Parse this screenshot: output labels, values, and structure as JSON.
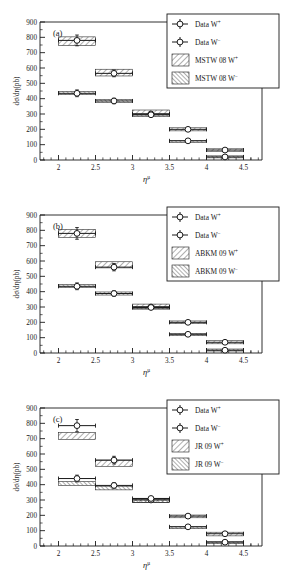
{
  "figure": {
    "width": 282,
    "height": 580,
    "panel_count": 3
  },
  "axes": {
    "ylabel": "dσ/dη(pb)",
    "xlabel_base": "η",
    "xlabel_sup": "μ",
    "ylim": [
      0,
      900
    ],
    "xlim": [
      1.75,
      4.75
    ],
    "yticks": [
      0,
      100,
      200,
      300,
      400,
      500,
      600,
      700,
      800,
      900
    ],
    "ytick_labels": [
      "0",
      "100",
      "200",
      "300",
      "400",
      "500",
      "600",
      "700",
      "800",
      "900"
    ],
    "xticks": [
      2,
      2.5,
      3,
      3.5,
      4,
      4.5
    ],
    "xtick_labels": [
      "2",
      "2.5",
      "3",
      "3.5",
      "4",
      "4.5"
    ],
    "minor_y_step": 50,
    "minor_x_step": 0.1,
    "grid": false
  },
  "legend": {
    "position": "top-right",
    "entries_common": [
      {
        "marker": "open-circle-errorbar",
        "label_base": "Data  W",
        "label_sup": "+"
      },
      {
        "marker": "open-circle-errorbar",
        "label_base": "Data  W",
        "label_sup": "−"
      }
    ]
  },
  "panels": [
    {
      "tag": "(a)",
      "model": "MSTW 08",
      "legend": [
        {
          "marker": "open-circle-errorbar",
          "label_base": "Data  W",
          "label_sup": "+"
        },
        {
          "marker": "open-circle-errorbar",
          "label_base": "Data  W",
          "label_sup": "−"
        },
        {
          "marker": "hatch-forward",
          "label_base": "MSTW 08 W",
          "label_sup": "+"
        },
        {
          "marker": "hatch-back",
          "label_base": "MSTW 08 W",
          "label_sup": "−"
        }
      ],
      "chart_ref": 0
    },
    {
      "tag": "(b)",
      "model": "ABKM 09",
      "legend": [
        {
          "marker": "open-circle-errorbar",
          "label_base": "Data  W",
          "label_sup": "+"
        },
        {
          "marker": "open-circle-errorbar",
          "label_base": "Data  W",
          "label_sup": "−"
        },
        {
          "marker": "hatch-forward",
          "label_base": "ABKM 09 W",
          "label_sup": "+"
        },
        {
          "marker": "hatch-back",
          "label_base": "ABKM 09 W",
          "label_sup": "−"
        }
      ],
      "chart_ref": 1
    },
    {
      "tag": "(c)",
      "model": "JR 09",
      "legend": [
        {
          "marker": "open-circle-errorbar",
          "label_base": "Data  W",
          "label_sup": "+"
        },
        {
          "marker": "open-circle-errorbar",
          "label_base": "Data  W",
          "label_sup": "−"
        },
        {
          "marker": "hatch-forward",
          "label_base": "JR 09 W",
          "label_sup": "+"
        },
        {
          "marker": "hatch-back",
          "label_base": "JR 09 W",
          "label_sup": "−"
        }
      ],
      "chart_ref": 2
    }
  ],
  "chart_data": [
    {
      "type": "scatter",
      "title": "(a) MSTW 08 prediction vs data",
      "xlabel": "eta_mu",
      "ylabel": "dsigma/deta (pb)",
      "xlim": [
        1.75,
        4.75
      ],
      "ylim": [
        0,
        900
      ],
      "grid": false,
      "bin_edges": [
        [
          2.0,
          2.5
        ],
        [
          2.5,
          3.0
        ],
        [
          3.0,
          3.5
        ],
        [
          3.5,
          4.0
        ],
        [
          4.0,
          4.5
        ]
      ],
      "x": [
        2.25,
        2.75,
        3.25,
        3.75,
        4.25
      ],
      "series": [
        {
          "name": "Data W+",
          "marker": "open-circle",
          "values": [
            780,
            565,
            300,
            200,
            65
          ],
          "yerr": [
            35,
            22,
            14,
            11,
            7
          ]
        },
        {
          "name": "Data W-",
          "marker": "open-circle",
          "values": [
            435,
            385,
            295,
            125,
            20
          ],
          "yerr": [
            22,
            18,
            13,
            9,
            5
          ]
        },
        {
          "name": "MSTW 08 W+",
          "marker": "hatch-band",
          "band_center": [
            775,
            570,
            310,
            200,
            65
          ],
          "band_half": [
            28,
            22,
            16,
            10,
            8
          ]
        },
        {
          "name": "MSTW 08 W-",
          "marker": "hatch-band",
          "band_center": [
            437,
            385,
            293,
            122,
            22
          ],
          "band_half": [
            10,
            9,
            9,
            6,
            5
          ]
        }
      ]
    },
    {
      "type": "scatter",
      "title": "(b) ABKM 09 prediction vs data",
      "xlabel": "eta_mu",
      "ylabel": "dsigma/deta (pb)",
      "xlim": [
        1.75,
        4.75
      ],
      "ylim": [
        0,
        900
      ],
      "grid": false,
      "bin_edges": [
        [
          2.0,
          2.5
        ],
        [
          2.5,
          3.0
        ],
        [
          3.0,
          3.5
        ],
        [
          3.5,
          4.0
        ],
        [
          4.0,
          4.5
        ]
      ],
      "x": [
        2.25,
        2.75,
        3.25,
        3.75,
        4.25
      ],
      "series": [
        {
          "name": "Data W+",
          "marker": "open-circle",
          "values": [
            780,
            560,
            300,
            200,
            70
          ],
          "yerr": [
            38,
            24,
            14,
            11,
            8
          ]
        },
        {
          "name": "Data W-",
          "marker": "open-circle",
          "values": [
            435,
            388,
            297,
            122,
            18
          ],
          "yerr": [
            22,
            18,
            13,
            9,
            5
          ]
        },
        {
          "name": "ABKM 09 W+",
          "marker": "hatch-band",
          "band_center": [
            780,
            575,
            305,
            200,
            70
          ],
          "band_half": [
            26,
            20,
            14,
            9,
            10
          ]
        },
        {
          "name": "ABKM 09 W-",
          "marker": "hatch-band",
          "band_center": [
            437,
            388,
            295,
            120,
            20
          ],
          "band_half": [
            9,
            10,
            9,
            7,
            6
          ]
        }
      ]
    },
    {
      "type": "scatter",
      "title": "(c) JR 09 prediction vs data",
      "xlabel": "eta_mu",
      "ylabel": "dsigma/deta (pb)",
      "xlim": [
        1.75,
        4.75
      ],
      "ylim": [
        0,
        900
      ],
      "grid": false,
      "bin_edges": [
        [
          2.0,
          2.5
        ],
        [
          2.5,
          3.0
        ],
        [
          3.0,
          3.5
        ],
        [
          3.5,
          4.0
        ],
        [
          4.0,
          4.5
        ]
      ],
      "x": [
        2.25,
        2.75,
        3.25,
        3.75,
        4.25
      ],
      "series": [
        {
          "name": "Data W+",
          "marker": "open-circle",
          "values": [
            785,
            560,
            300,
            195,
            80
          ],
          "yerr": [
            40,
            25,
            14,
            11,
            9
          ]
        },
        {
          "name": "Data W-",
          "marker": "open-circle",
          "values": [
            440,
            395,
            310,
            125,
            25
          ],
          "yerr": [
            22,
            18,
            13,
            9,
            5
          ]
        },
        {
          "name": "JR 09 W+",
          "marker": "hatch-band",
          "band_center": [
            718,
            540,
            297,
            193,
            78
          ],
          "band_half": [
            22,
            20,
            13,
            9,
            12
          ]
        },
        {
          "name": "JR 09 W-",
          "marker": "hatch-band",
          "band_center": [
            408,
            378,
            293,
            120,
            22
          ],
          "band_half": [
            12,
            12,
            10,
            7,
            6
          ]
        }
      ]
    }
  ],
  "style": {
    "axis_color": "#1a1a1a",
    "marker_fill": "#ffffff",
    "marker_edge": "#1a1a1a",
    "band_edge": "#1a1a1a",
    "background": "#ffffff"
  }
}
